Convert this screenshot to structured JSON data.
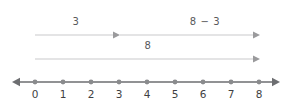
{
  "diagram": {
    "colors": {
      "bar_line": "#c9c9cb",
      "bar_arrow": "#9a9a9c",
      "axis_line": "#6d6e71",
      "axis_dot": "#8a8b8d",
      "tick_text": "#3f3f42",
      "label_text": "#58595b",
      "background": "#ffffff"
    },
    "bars": [
      {
        "id": "bar-three",
        "label": "3",
        "from_value": 0,
        "to_value": 3,
        "label_x": 76,
        "label_y": 22,
        "y": 35
      },
      {
        "id": "bar-eight-minus-three",
        "label": "8 − 3",
        "from_value": 3,
        "to_value": 8,
        "label_x": 205,
        "label_y": 22,
        "y": 35
      },
      {
        "id": "bar-eight",
        "label": "8",
        "from_value": 0,
        "to_value": 8,
        "label_x": 148,
        "label_y": 46,
        "y": 59
      }
    ],
    "number_line": {
      "y": 82,
      "left_arrow": true,
      "right_arrow": true,
      "start_x": 35,
      "spacing": 28,
      "ticks": [
        {
          "value": 0,
          "label": "0",
          "x": 35
        },
        {
          "value": 1,
          "label": "1",
          "x": 63
        },
        {
          "value": 2,
          "label": "2",
          "x": 91
        },
        {
          "value": 3,
          "label": "3",
          "x": 119
        },
        {
          "value": 4,
          "label": "4",
          "x": 147
        },
        {
          "value": 5,
          "label": "5",
          "x": 175
        },
        {
          "value": 6,
          "label": "6",
          "x": 203
        },
        {
          "value": 7,
          "label": "7",
          "x": 231
        },
        {
          "value": 8,
          "label": "8",
          "x": 259
        }
      ],
      "tick_label_y": 89
    }
  }
}
